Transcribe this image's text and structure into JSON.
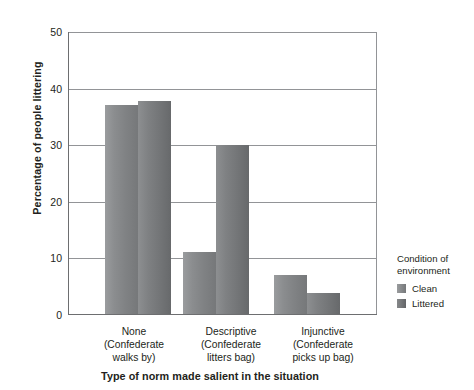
{
  "chart_data": {
    "type": "bar",
    "title": "",
    "categories": [
      "None\n(Confederate walks by)",
      "Descriptive\n(Confederate litters bag)",
      "Injunctive\n(Confederate picks up bag)"
    ],
    "series": [
      {
        "name": "Clean",
        "values": [
          37,
          11,
          7
        ],
        "color": "#86888a"
      },
      {
        "name": "Littered",
        "values": [
          37.8,
          30,
          3.7
        ],
        "color": "#76787a"
      }
    ],
    "xlabel": "Type of norm made salient in the situation",
    "ylabel": "Percentage of people littering",
    "ylim": [
      0,
      50
    ],
    "yticks": [
      0,
      10,
      20,
      30,
      40,
      50
    ],
    "grid": "horizontal",
    "legend_position": "right"
  },
  "axes": {
    "y": {
      "title": "Percentage of people littering",
      "ticks": [
        {
          "label": "50",
          "value": 50
        },
        {
          "label": "40",
          "value": 40
        },
        {
          "label": "30",
          "value": 30
        },
        {
          "label": "20",
          "value": 20
        },
        {
          "label": "10",
          "value": 10
        },
        {
          "label": "0",
          "value": 0
        }
      ]
    },
    "x": {
      "title": "Type of norm made salient in the situation",
      "groups": [
        {
          "head": "None",
          "sub1": "(Confederate",
          "sub2": "walks by)"
        },
        {
          "head": "Descriptive",
          "sub1": "(Confederate",
          "sub2": "litters bag)"
        },
        {
          "head": "Injunctive",
          "sub1": "(Confederate",
          "sub2": "picks up bag)"
        }
      ]
    }
  },
  "legend": {
    "title_line1": "Condition of",
    "title_line2": "environment",
    "items": [
      {
        "label": "Clean",
        "swatch": "clean"
      },
      {
        "label": "Littered",
        "swatch": "littered"
      }
    ]
  }
}
